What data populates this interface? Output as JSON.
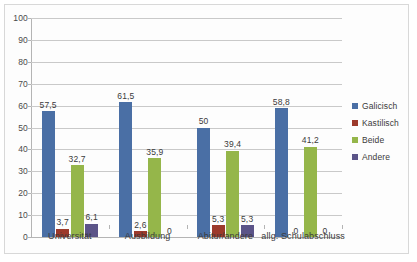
{
  "chart_data": {
    "type": "bar",
    "title": "",
    "xlabel": "",
    "ylabel": "",
    "ylim": [
      0,
      100
    ],
    "ytick_step": 10,
    "ytick_labels": [
      "0",
      "10",
      "20",
      "30",
      "40",
      "50",
      "60",
      "70",
      "80",
      "90",
      "100"
    ],
    "grid": true,
    "legend_position": "right",
    "categories": [
      "Universität",
      "Ausbildung",
      "Abitur/andere",
      "allg. Schulabschluss"
    ],
    "series": [
      {
        "name": "Galicisch",
        "color": "#4a6fa5",
        "values": [
          57.5,
          61.5,
          50,
          58.8
        ],
        "labels": [
          "57,5",
          "61,5",
          "50",
          "58,8"
        ]
      },
      {
        "name": "Kastilisch",
        "color": "#9c3a2b",
        "values": [
          3.7,
          2.6,
          5.3,
          0
        ],
        "labels": [
          "3,7",
          "2,6",
          "5,3",
          "0"
        ]
      },
      {
        "name": "Beide",
        "color": "#95b64a",
        "values": [
          32.7,
          35.9,
          39.4,
          41.2
        ],
        "labels": [
          "32,7",
          "35,9",
          "39,4",
          "41,2"
        ]
      },
      {
        "name": "Andere",
        "color": "#5b5488",
        "values": [
          6.1,
          0,
          5.3,
          0
        ],
        "labels": [
          "6,1",
          "0",
          "5,3",
          "0"
        ]
      }
    ]
  }
}
